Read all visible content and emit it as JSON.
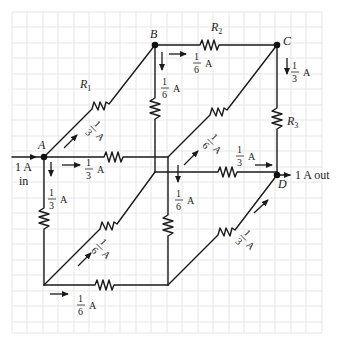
{
  "figure": {
    "nodes": {
      "A": {
        "label": "A"
      },
      "B": {
        "label": "B"
      },
      "C": {
        "label": "C"
      },
      "D": {
        "label": "D"
      }
    },
    "resistors": {
      "R1": {
        "label": "R",
        "sub": "1"
      },
      "R2": {
        "label": "R",
        "sub": "2"
      },
      "R3": {
        "label": "R",
        "sub": "3"
      }
    },
    "terminals": {
      "input": {
        "current": "1 A",
        "suffix": "in"
      },
      "output": {
        "current": "1 A out"
      }
    },
    "currents": {
      "AB": {
        "num": "1",
        "den": "3",
        "unit": "A"
      },
      "A_right": {
        "num": "1",
        "den": "3",
        "unit": "A"
      },
      "A_down": {
        "num": "1",
        "den": "3",
        "unit": "A"
      },
      "BC": {
        "num": "1",
        "den": "6",
        "unit": "A"
      },
      "B_down": {
        "num": "1",
        "den": "6",
        "unit": "A"
      },
      "C_down": {
        "num": "1",
        "den": "3",
        "unit": "A"
      },
      "inner_diag_up": {
        "num": "1",
        "den": "6",
        "unit": "A"
      },
      "inner_to_D": {
        "num": "1",
        "den": "3",
        "unit": "A"
      },
      "inner_down": {
        "num": "1",
        "den": "6",
        "unit": "A"
      },
      "bottom_diag": {
        "num": "1",
        "den": "6",
        "unit": "A"
      },
      "bottom_right": {
        "num": "1",
        "den": "6",
        "unit": "A"
      },
      "front_diag_D": {
        "num": "1",
        "den": "3",
        "unit": "A"
      }
    },
    "colors": {
      "wire": "#1a1a1a",
      "grid": "#e6e6e6",
      "background": "#ffffff"
    }
  }
}
